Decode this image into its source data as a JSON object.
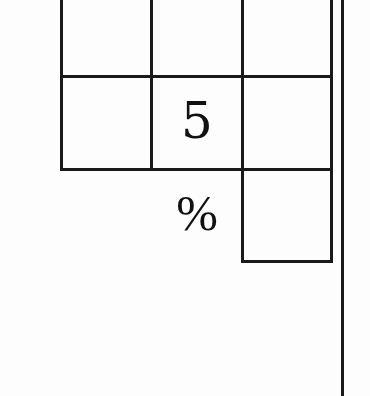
{
  "figure": {
    "type": "partial grid puzzle diagram",
    "grid": {
      "columns": 3,
      "visible_rows": 2,
      "cells": [
        [
          "",
          "",
          ""
        ],
        [
          "",
          "5",
          ""
        ]
      ]
    },
    "extra_box": {
      "below_column": 3,
      "value": ""
    },
    "labels": {
      "digit_cell": "5",
      "percent_symbol": "%"
    },
    "colors": {
      "line": "#1a1a1a",
      "background": "#fdfdfd",
      "text": "#111111"
    }
  }
}
